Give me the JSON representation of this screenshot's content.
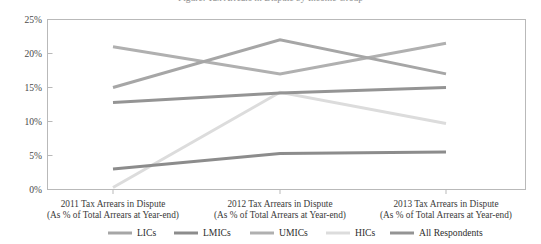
{
  "figure": {
    "title_cropped": "Figure: Tax Arrears in Dispute by Income Group"
  },
  "chart_data": {
    "type": "line",
    "title": "",
    "xlabel": "",
    "ylabel": "",
    "ylim": [
      0,
      25
    ],
    "ytick_labels": [
      "0%",
      "5%",
      "10%",
      "15%",
      "20%",
      "25%"
    ],
    "ytick_values": [
      0,
      5,
      10,
      15,
      20,
      25
    ],
    "grid": false,
    "legend_position": "bottom",
    "categories": [
      "2011 Tax Arrears in Dispute",
      "2012 Tax Arrears in Dispute",
      "2013 Tax Arrears in Dispute"
    ],
    "category_sublabels": [
      "(As % of Total Arrears at Year-end)",
      "(As % of Total Arrears at Year-end)",
      "(As % of Total Arrears at Year-end)"
    ],
    "series": [
      {
        "name": "LICs",
        "values": [
          15.0,
          22.0,
          17.0
        ],
        "color": "#a6a6a6"
      },
      {
        "name": "LMICs",
        "values": [
          3.0,
          5.3,
          5.5
        ],
        "color": "#8c8c8c"
      },
      {
        "name": "UMICs",
        "values": [
          21.0,
          17.0,
          21.5
        ],
        "color": "#b0b0b0"
      },
      {
        "name": "HICs",
        "values": [
          0.3,
          14.3,
          9.7
        ],
        "color": "#dcdcdc"
      },
      {
        "name": "All Respondents",
        "values": [
          12.8,
          14.2,
          15.0
        ],
        "color": "#949494"
      }
    ]
  },
  "axis": {
    "frame_color": "#b9b9b9"
  }
}
